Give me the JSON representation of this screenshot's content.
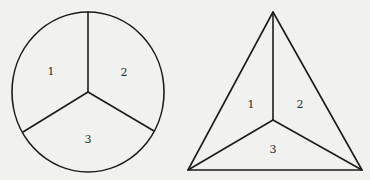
{
  "figure": {
    "circle_diagram": {
      "shape": "circle divided into three regions by three radial spokes",
      "regions": [
        {
          "label": "1"
        },
        {
          "label": "2"
        },
        {
          "label": "3"
        }
      ]
    },
    "triangle_diagram": {
      "shape": "triangle divided into three regions by lines from an interior point to each vertex",
      "regions": [
        {
          "label": "1"
        },
        {
          "label": "2"
        },
        {
          "label": "3"
        }
      ]
    },
    "colors": {
      "background": "#f1f1ef",
      "line": "#1c1c1c",
      "text": "#2a2a2a"
    }
  }
}
